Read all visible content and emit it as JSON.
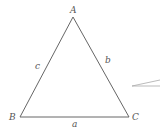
{
  "diagram": {
    "type": "triangle",
    "vertices": {
      "A": {
        "label": "A",
        "x": 73,
        "y": 17
      },
      "B": {
        "label": "B",
        "x": 20,
        "y": 117
      },
      "C": {
        "label": "C",
        "x": 129,
        "y": 117
      }
    },
    "sides": {
      "a": {
        "label": "a"
      },
      "b": {
        "label": "b"
      },
      "c": {
        "label": "c"
      }
    },
    "colors": {
      "stroke": "#666666",
      "text": "#555555",
      "background": "#ffffff"
    }
  }
}
